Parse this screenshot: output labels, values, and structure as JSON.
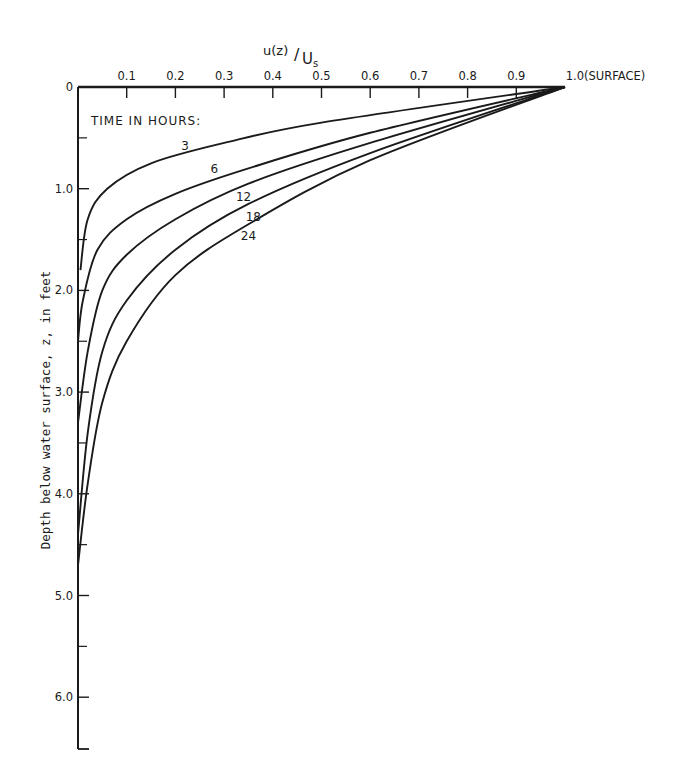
{
  "chart_data": {
    "type": "line",
    "title": "",
    "xlabel": "u(z)/U_s",
    "ylabel": "Depth below water surface, z, in feet",
    "xlim": [
      0,
      1.0
    ],
    "ylim": [
      6.5,
      0
    ],
    "x_axis_position": "top",
    "y_inverted": true,
    "grid": false,
    "x_ticks": [
      "0.1",
      "0.2",
      "0.3",
      "0.4",
      "0.5",
      "0.6",
      "0.7",
      "0.8",
      "0.9",
      "1.0"
    ],
    "x_tick_end_annotation": "(SURFACE)",
    "y_ticks": [
      "0",
      "1.0",
      "2.0",
      "3.0",
      "4.0",
      "5.0",
      "6.0"
    ],
    "legend_title": "TIME IN HOURS:",
    "series": [
      {
        "name": "3",
        "label": "3",
        "points": [
          [
            1.0,
            0
          ],
          [
            0.5,
            0.35
          ],
          [
            0.3,
            0.55
          ],
          [
            0.15,
            0.75
          ],
          [
            0.06,
            1.0
          ],
          [
            0.02,
            1.3
          ],
          [
            0.005,
            1.8
          ]
        ]
      },
      {
        "name": "6",
        "label": "6",
        "points": [
          [
            1.0,
            0
          ],
          [
            0.6,
            0.45
          ],
          [
            0.35,
            0.8
          ],
          [
            0.2,
            1.05
          ],
          [
            0.1,
            1.3
          ],
          [
            0.04,
            1.6
          ],
          [
            0.01,
            2.1
          ],
          [
            0,
            2.5
          ]
        ]
      },
      {
        "name": "12",
        "label": "12",
        "points": [
          [
            1.0,
            0
          ],
          [
            0.6,
            0.55
          ],
          [
            0.35,
            0.95
          ],
          [
            0.2,
            1.3
          ],
          [
            0.1,
            1.65
          ],
          [
            0.05,
            2.0
          ],
          [
            0.02,
            2.6
          ],
          [
            0,
            3.3
          ]
        ]
      },
      {
        "name": "18",
        "label": "18",
        "points": [
          [
            1.0,
            0
          ],
          [
            0.6,
            0.65
          ],
          [
            0.35,
            1.15
          ],
          [
            0.2,
            1.6
          ],
          [
            0.1,
            2.1
          ],
          [
            0.05,
            2.6
          ],
          [
            0.02,
            3.4
          ],
          [
            0,
            4.4
          ]
        ]
      },
      {
        "name": "24",
        "label": "24",
        "points": [
          [
            1.0,
            0
          ],
          [
            0.6,
            0.72
          ],
          [
            0.35,
            1.35
          ],
          [
            0.2,
            1.85
          ],
          [
            0.1,
            2.5
          ],
          [
            0.05,
            3.1
          ],
          [
            0.02,
            3.9
          ],
          [
            0,
            4.7
          ]
        ]
      }
    ],
    "annotations": [
      {
        "text": "3",
        "u": 0.22,
        "z": 0.62
      },
      {
        "text": "6",
        "u": 0.28,
        "z": 0.85
      },
      {
        "text": "12",
        "u": 0.34,
        "z": 1.12
      },
      {
        "text": "18",
        "u": 0.36,
        "z": 1.32
      },
      {
        "text": "24",
        "u": 0.35,
        "z": 1.5
      }
    ]
  },
  "labels": {
    "x_axis_title_main": "u(z)",
    "x_axis_title_slash": "/",
    "x_axis_title_denom": "U",
    "x_axis_title_sub": "s",
    "surface": "(SURFACE)",
    "legend_title": "TIME IN HOURS:",
    "y_axis_title": "Depth below water surface, z, in feet"
  }
}
